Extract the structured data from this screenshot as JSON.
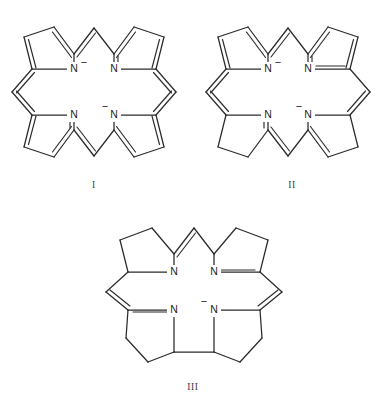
{
  "figure": {
    "background_color": "#ffffff",
    "line_color": "#2b2b2b",
    "text_color": "#1d1d1d",
    "structures": [
      {
        "id": "structure-1",
        "caption": "I",
        "name": "porphyrin-dianion",
        "nitrogen_labels": [
          "N",
          "N",
          "N",
          "N"
        ],
        "charges": [
          "−",
          "",
          "",
          "−"
        ],
        "charged_positions": [
          "top-left",
          "bottom-right"
        ],
        "meso_bridges": 4,
        "rings": 4
      },
      {
        "id": "structure-2",
        "caption": "II",
        "name": "porphyrin-isomer-partially-reduced",
        "nitrogen_labels": [
          "N",
          "N",
          "N",
          "N"
        ],
        "charges": [
          "−",
          "",
          "",
          "−"
        ],
        "charged_positions": [
          "top-left",
          "bottom-right"
        ],
        "meso_bridges": 4,
        "rings": 4
      },
      {
        "id": "structure-3",
        "caption": "III",
        "name": "contracted-macrocycle-monoanion",
        "nitrogen_labels": [
          "N",
          "N",
          "N",
          "N"
        ],
        "charges": [
          "",
          "",
          "",
          "−"
        ],
        "charged_positions": [
          "bottom-right"
        ],
        "meso_bridges": 3,
        "rings": 4
      }
    ]
  },
  "atoms": {
    "nitrogen": "N",
    "minus": "−"
  }
}
